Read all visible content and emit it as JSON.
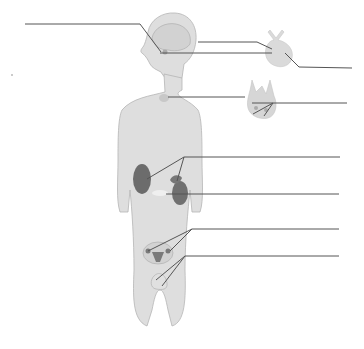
{
  "diagram": {
    "figure": "human body outline with endocrine glands",
    "label_lines_count": 10,
    "labels": [
      {
        "id": "hypothalamus-blank",
        "text": ""
      },
      {
        "id": "pituitary-blank",
        "text": ""
      },
      {
        "id": "pituitary-inset-blank",
        "text": ""
      },
      {
        "id": "pituitary-inset-lower-blank",
        "text": ""
      },
      {
        "id": "thyroid-blank",
        "text": ""
      },
      {
        "id": "parathyroid-blank",
        "text": ""
      },
      {
        "id": "adrenal-blank",
        "text": ""
      },
      {
        "id": "pancreas-blank",
        "text": ""
      },
      {
        "id": "ovaries-blank",
        "text": ""
      },
      {
        "id": "testes-blank",
        "text": ""
      }
    ],
    "colors": {
      "body_fill": "#dcdcdc",
      "body_stroke": "#b0b0b0",
      "organ_dark": "#6f6f6f",
      "line": "#555555"
    }
  }
}
